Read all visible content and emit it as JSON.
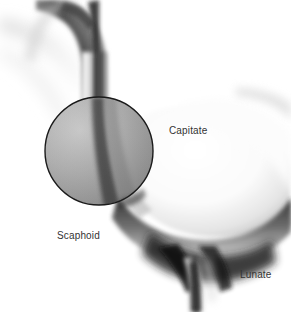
{
  "figure": {
    "kind": "wrist-radiograph",
    "width": 291,
    "height": 312,
    "background_color": "#ffffff"
  },
  "labels": [
    {
      "id": "capitate",
      "text": "Capitate",
      "x": 169,
      "y": 125,
      "color": "#333333"
    },
    {
      "id": "scaphoid",
      "text": "Scaphoid",
      "x": 57,
      "y": 230,
      "color": "#333333"
    },
    {
      "id": "lunate",
      "text": "Lunate",
      "x": 240,
      "y": 269,
      "color": "#333333"
    }
  ],
  "overlay": {
    "shape": "circle",
    "center_x": 99,
    "center_y": 151,
    "radius": 54,
    "stroke_color": "#1a1a1a",
    "fill_color": "rgba(40,40,40,0.18)"
  },
  "anatomy": {
    "bones": [
      {
        "name": "radius-shaft",
        "tone": "#6e6e6e"
      },
      {
        "name": "scaphoid",
        "tone": "#9a9a9a"
      },
      {
        "name": "capitate",
        "tone": "#f2f2f2"
      },
      {
        "name": "lunate",
        "tone": "#cfcfcf"
      }
    ],
    "joint_space_color": "#171717"
  }
}
